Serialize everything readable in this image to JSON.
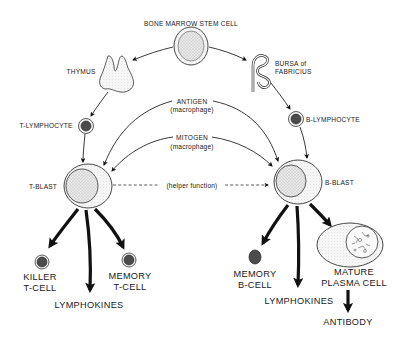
{
  "diagram": {
    "nodes": {
      "stem_cell": {
        "label": "BONE MARROW STEM CELL"
      },
      "thymus": {
        "label": "THYMUS"
      },
      "bursa": {
        "label_line1": "BURSA of",
        "label_line2": "FABRICIUS"
      },
      "t_lymphocyte": {
        "label": "T-LYMPHOCYTE"
      },
      "b_lymphocyte": {
        "label": "B-LYMPHOCYTE"
      },
      "t_blast": {
        "label": "T-BLAST"
      },
      "b_blast": {
        "label": "B-BLAST"
      },
      "killer_t_cell": {
        "label_line1": "KILLER",
        "label_line2": "T-CELL"
      },
      "memory_t_cell": {
        "label_line1": "MEMORY",
        "label_line2": "T-CELL"
      },
      "lymphokines_t": {
        "label": "LYMPHOKINES"
      },
      "memory_b_cell": {
        "label_line1": "MEMORY",
        "label_line2": "B-CELL"
      },
      "lymphokines_b": {
        "label": "LYMPHOKINES"
      },
      "plasma_cell": {
        "label_line1": "MATURE",
        "label_line2": "PLASMA CELL"
      },
      "antibody": {
        "label": "ANTIBODY"
      }
    },
    "edge_labels": {
      "antigen": "ANTIGEN",
      "antigen_sub": "(macrophage)",
      "mitogen": "MITOGEN",
      "mitogen_sub": "(macrophage)",
      "helper": "(helper function)"
    },
    "edges": [
      {
        "from": "BONE MARROW STEM CELL",
        "to": "THYMUS"
      },
      {
        "from": "BONE MARROW STEM CELL",
        "to": "BURSA of FABRICIUS"
      },
      {
        "from": "THYMUS",
        "to": "T-LYMPHOCYTE"
      },
      {
        "from": "BURSA of FABRICIUS",
        "to": "B-LYMPHOCYTE"
      },
      {
        "from": "T-LYMPHOCYTE",
        "to": "T-BLAST"
      },
      {
        "from": "B-LYMPHOCYTE",
        "to": "B-BLAST"
      },
      {
        "from": "ANTIGEN (macrophage)",
        "to": "T-BLAST"
      },
      {
        "from": "ANTIGEN (macrophage)",
        "to": "B-BLAST"
      },
      {
        "from": "MITOGEN (macrophage)",
        "to": "T-BLAST"
      },
      {
        "from": "MITOGEN (macrophage)",
        "to": "B-BLAST"
      },
      {
        "from": "T-BLAST",
        "to": "B-BLAST",
        "label": "(helper function)",
        "style": "dashed"
      },
      {
        "from": "T-BLAST",
        "to": "KILLER T-CELL"
      },
      {
        "from": "T-BLAST",
        "to": "LYMPHOKINES"
      },
      {
        "from": "T-BLAST",
        "to": "MEMORY T-CELL"
      },
      {
        "from": "B-BLAST",
        "to": "MEMORY B-CELL"
      },
      {
        "from": "B-BLAST",
        "to": "LYMPHOKINES"
      },
      {
        "from": "B-BLAST",
        "to": "MATURE PLASMA CELL"
      },
      {
        "from": "MATURE PLASMA CELL",
        "to": "ANTIBODY"
      }
    ]
  }
}
